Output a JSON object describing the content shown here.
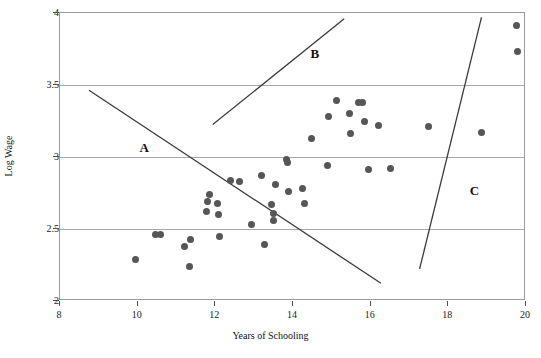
{
  "chart_data": {
    "type": "scatter",
    "title": "",
    "xlabel": "Years of Schooling",
    "ylabel": "Log Wage",
    "xlim": [
      8,
      20
    ],
    "ylim": [
      2,
      4
    ],
    "xticks": [
      8,
      10,
      12,
      14,
      16,
      18,
      20
    ],
    "yticks": [
      2,
      2.5,
      3,
      3.5,
      4
    ],
    "xtick_labels": [
      "8",
      "10",
      "12",
      "14",
      "16",
      "18",
      "20"
    ],
    "ytick_labels": [
      "2",
      "2.5",
      "3",
      "3.5",
      "4"
    ],
    "grid": "horizontal",
    "legend": "none",
    "marker_color": "#565656",
    "line_color": "#3a3a3a",
    "grid_color": "#a8a8a8",
    "points": [
      {
        "x": 9.95,
        "y": 2.29
      },
      {
        "x": 10.45,
        "y": 2.46
      },
      {
        "x": 10.58,
        "y": 2.46
      },
      {
        "x": 11.2,
        "y": 2.38
      },
      {
        "x": 11.35,
        "y": 2.43
      },
      {
        "x": 11.33,
        "y": 2.24
      },
      {
        "x": 11.78,
        "y": 2.62
      },
      {
        "x": 11.8,
        "y": 2.69
      },
      {
        "x": 11.85,
        "y": 2.74
      },
      {
        "x": 12.05,
        "y": 2.68
      },
      {
        "x": 12.08,
        "y": 2.6
      },
      {
        "x": 12.1,
        "y": 2.45
      },
      {
        "x": 12.4,
        "y": 2.84
      },
      {
        "x": 12.62,
        "y": 2.83
      },
      {
        "x": 12.92,
        "y": 2.53
      },
      {
        "x": 13.2,
        "y": 2.87
      },
      {
        "x": 13.27,
        "y": 2.39
      },
      {
        "x": 13.45,
        "y": 2.67
      },
      {
        "x": 13.5,
        "y": 2.61
      },
      {
        "x": 13.5,
        "y": 2.56
      },
      {
        "x": 13.55,
        "y": 2.81
      },
      {
        "x": 13.82,
        "y": 2.98
      },
      {
        "x": 13.85,
        "y": 2.96
      },
      {
        "x": 13.88,
        "y": 2.76
      },
      {
        "x": 14.25,
        "y": 2.78
      },
      {
        "x": 14.3,
        "y": 2.68
      },
      {
        "x": 14.48,
        "y": 3.13
      },
      {
        "x": 14.88,
        "y": 2.94
      },
      {
        "x": 14.92,
        "y": 3.28
      },
      {
        "x": 15.12,
        "y": 3.39
      },
      {
        "x": 15.45,
        "y": 3.3
      },
      {
        "x": 15.48,
        "y": 3.16
      },
      {
        "x": 15.68,
        "y": 3.38
      },
      {
        "x": 15.8,
        "y": 3.38
      },
      {
        "x": 15.85,
        "y": 3.25
      },
      {
        "x": 15.95,
        "y": 2.91
      },
      {
        "x": 16.2,
        "y": 3.22
      },
      {
        "x": 16.52,
        "y": 2.92
      },
      {
        "x": 17.48,
        "y": 3.21
      },
      {
        "x": 18.85,
        "y": 3.17
      },
      {
        "x": 19.75,
        "y": 3.91
      },
      {
        "x": 19.78,
        "y": 3.73
      }
    ],
    "lines": [
      {
        "label": "A",
        "x1": 8.75,
        "y1": 3.46,
        "x2": 16.3,
        "y2": 2.11,
        "label_x": 10.05,
        "label_y": 3.12
      },
      {
        "label": "B",
        "x1": 11.95,
        "y1": 3.22,
        "x2": 15.35,
        "y2": 3.96,
        "label_x": 14.45,
        "label_y": 3.77
      },
      {
        "label": "C",
        "x1": 17.3,
        "y1": 2.21,
        "x2": 18.9,
        "y2": 3.97,
        "label_x": 18.55,
        "label_y": 2.82
      }
    ]
  }
}
